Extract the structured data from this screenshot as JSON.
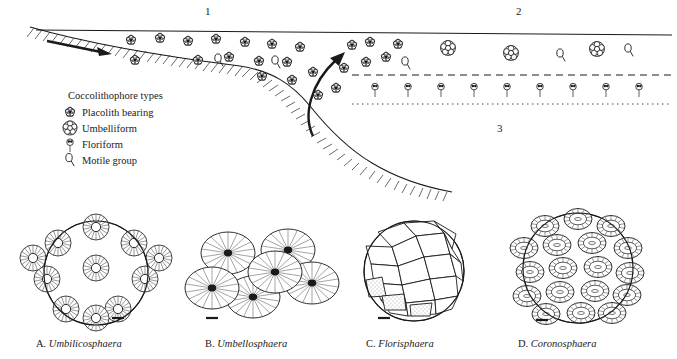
{
  "figure": {
    "kind": "scientific-diagram",
    "ink_color": "#1a1a1a",
    "background": "#ffffff"
  },
  "zones": [
    {
      "id": "1",
      "label": "1"
    },
    {
      "id": "2",
      "label": "2"
    },
    {
      "id": "3",
      "label": "3"
    }
  ],
  "legend": {
    "title": "Coccolithophore types",
    "items": [
      {
        "icon": "placolith-bearing-icon",
        "label": "Placolith bearing"
      },
      {
        "icon": "umbelliform-icon",
        "label": "Umbelliform"
      },
      {
        "icon": "floriform-icon",
        "label": "Floriform"
      },
      {
        "icon": "motile-group-icon",
        "label": "Motile group"
      }
    ]
  },
  "specimens": [
    {
      "letter": "A.",
      "genus": "Umbilicosphaera",
      "scalebar": true
    },
    {
      "letter": "B.",
      "genus": "Umbellosphaera",
      "scalebar": true
    },
    {
      "letter": "C.",
      "genus": "Florisphaera",
      "scalebar": true
    },
    {
      "letter": "D.",
      "genus": "Coronosphaera",
      "scalebar": true
    }
  ]
}
